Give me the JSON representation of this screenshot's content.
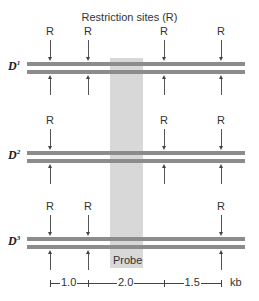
{
  "title": "Restriction sites (R)",
  "site_label": "R",
  "probe_label": "Probe",
  "scale_unit": "kb",
  "colors": {
    "bar": "#8c8c8c",
    "probe": "#d8d8d8",
    "text": "#333333"
  },
  "rows": [
    {
      "label": "D",
      "sup": "1",
      "sites": [
        50,
        88,
        164,
        221
      ]
    },
    {
      "label": "D",
      "sup": "2",
      "sites": [
        50,
        164,
        221
      ]
    },
    {
      "label": "D",
      "sup": "3",
      "sites": [
        50,
        88,
        221
      ]
    }
  ],
  "scale": {
    "segments": [
      {
        "label": "1.0",
        "from": 50,
        "to": 88
      },
      {
        "label": "2.0",
        "from": 88,
        "to": 164
      },
      {
        "label": "1.5",
        "from": 164,
        "to": 221
      }
    ]
  }
}
